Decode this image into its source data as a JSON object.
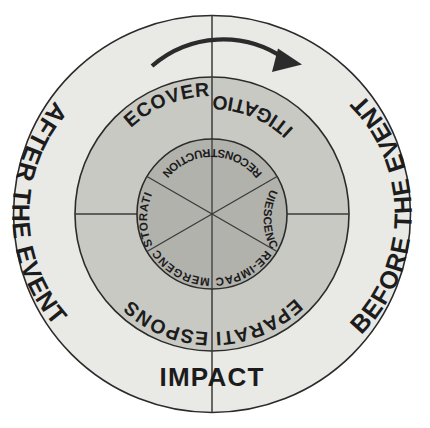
{
  "figure": {
    "type": "concentric-ring-diagram",
    "background_color": "#ffffff",
    "center": {
      "x": 212,
      "y": 214
    },
    "direction_indicator": "clockwise-arrow"
  },
  "colors": {
    "outer_ring_fill": "#e9e9e6",
    "middle_ring_fill": "#c9c9c4",
    "inner_circle_fill": "#b2b2ad",
    "stroke": "#2b2b2b",
    "text": "#1c1c1c"
  },
  "rings": {
    "outer": {
      "name": "phase-context-ring",
      "radius": 199,
      "labels": [
        {
          "id": "after-the-event",
          "text": "AFTER THE EVENT",
          "position": "left",
          "orientation": "top-to-bottom"
        },
        {
          "id": "before-the-event",
          "text": "BEFORE THE EVENT",
          "position": "right",
          "orientation": "bottom-to-top"
        },
        {
          "id": "impact",
          "text": "IMPACT",
          "position": "bottom",
          "orientation": "horizontal"
        }
      ]
    },
    "middle": {
      "name": "management-phase-ring",
      "radius": 137,
      "quadrants": [
        {
          "id": "recovery",
          "text": "RECOVERY",
          "quadrant": "upper-left"
        },
        {
          "id": "mitigation",
          "text": "MITIGATION",
          "quadrant": "upper-right"
        },
        {
          "id": "response",
          "text": "RESPONSE",
          "quadrant": "lower-left"
        },
        {
          "id": "preparation",
          "text": "PREPARATION",
          "quadrant": "lower-right"
        }
      ]
    },
    "inner": {
      "name": "disaster-stage-circle",
      "radius": 75,
      "sectors": [
        {
          "id": "reconstruction",
          "text": "RECONSTRUCTION",
          "sector": "top"
        },
        {
          "id": "quiescence",
          "text": "QUIESCENCE",
          "sector": "upper-right"
        },
        {
          "id": "pre-impact",
          "text": "PRE-IMPACT",
          "sector": "lower-right"
        },
        {
          "id": "emergency",
          "text": "EMERGENCY",
          "sector": "lower-left"
        },
        {
          "id": "restoration",
          "text": "RESTORATION",
          "sector": "upper-left"
        }
      ]
    }
  },
  "labels": {
    "outer_left": "AFTER THE EVENT",
    "outer_right": "BEFORE THE EVENT",
    "outer_bottom": "IMPACT",
    "mid_upper_left": "RECOVERY",
    "mid_upper_right": "MITIGATION",
    "mid_lower_left": "RESPONSE",
    "mid_lower_right": "PREPARATION",
    "inner_top": "RECONSTRUCTION",
    "inner_upper_right": "QUIESCENCE",
    "inner_lower_right": "PRE-IMPACT",
    "inner_lower_left": "EMERGENCY",
    "inner_upper_left": "RESTORATION"
  }
}
